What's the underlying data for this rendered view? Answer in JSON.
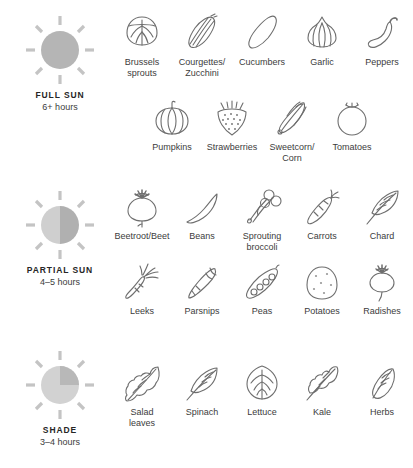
{
  "colors": {
    "sun_full": "#b5b5b5",
    "sun_light": "#cfcfcf",
    "sun_mid": "#bdbdbd",
    "sun_dark": "#a8a8a8",
    "ray": "#c4c4c4",
    "icon_stroke": "#6e6e6e",
    "text": "#3c3c3c",
    "title": "#262626",
    "background": "#ffffff"
  },
  "sections": [
    {
      "id": "full-sun",
      "icon": "full-sun-icon",
      "title": "FULL SUN",
      "hours": "6+ hours",
      "rows": [
        [
          {
            "icon": "brussels-sprouts-icon",
            "label": "Brussels\nsprouts"
          },
          {
            "icon": "courgette-zucchini-icon",
            "label": "Courgettes/\nZucchini"
          },
          {
            "icon": "cucumber-icon",
            "label": "Cucumbers"
          },
          {
            "icon": "garlic-icon",
            "label": "Garlic"
          },
          {
            "icon": "pepper-icon",
            "label": "Peppers"
          }
        ],
        [
          {
            "icon": "pumpkin-icon",
            "label": "Pumpkins"
          },
          {
            "icon": "strawberry-icon",
            "label": "Strawberries"
          },
          {
            "icon": "sweetcorn-icon",
            "label": "Sweetcorn/\nCorn"
          },
          {
            "icon": "tomato-icon",
            "label": "Tomatoes"
          }
        ]
      ]
    },
    {
      "id": "partial-sun",
      "icon": "partial-sun-icon",
      "title": "PARTIAL SUN",
      "hours": "4–5 hours",
      "rows": [
        [
          {
            "icon": "beetroot-icon",
            "label": "Beetroot/Beet"
          },
          {
            "icon": "beans-icon",
            "label": "Beans"
          },
          {
            "icon": "sprouting-broccoli-icon",
            "label": "Sprouting\nbroccoli"
          },
          {
            "icon": "carrot-icon",
            "label": "Carrots"
          },
          {
            "icon": "chard-icon",
            "label": "Chard"
          }
        ],
        [
          {
            "icon": "leek-icon",
            "label": "Leeks"
          },
          {
            "icon": "parsnip-icon",
            "label": "Parsnips"
          },
          {
            "icon": "peas-icon",
            "label": "Peas"
          },
          {
            "icon": "potato-icon",
            "label": "Potatoes"
          },
          {
            "icon": "radish-icon",
            "label": "Radishes"
          }
        ]
      ]
    },
    {
      "id": "shade",
      "icon": "shade-sun-icon",
      "title": "SHADE",
      "hours": "3–4 hours",
      "rows": [
        [
          {
            "icon": "salad-leaves-icon",
            "label": "Salad\nleaves"
          },
          {
            "icon": "spinach-icon",
            "label": "Spinach"
          },
          {
            "icon": "lettuce-icon",
            "label": "Lettuce"
          },
          {
            "icon": "kale-icon",
            "label": "Kale"
          },
          {
            "icon": "herbs-icon",
            "label": "Herbs"
          }
        ]
      ]
    }
  ]
}
